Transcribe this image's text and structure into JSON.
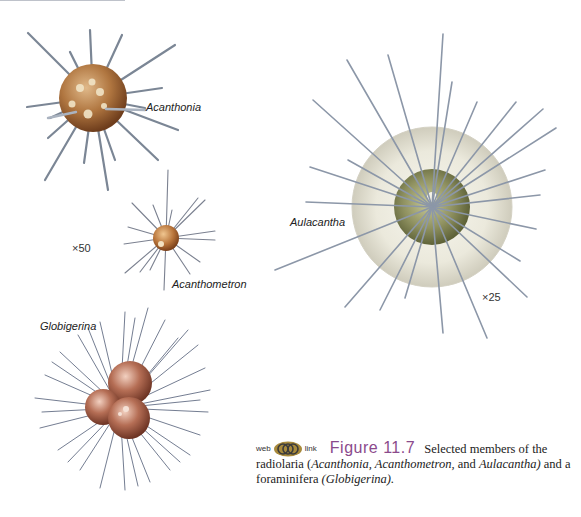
{
  "figure": {
    "number": "Figure 11.7",
    "caption_lead": "Selected members of the",
    "caption_line2_pre": "radiolaria (",
    "caption_taxa_1": "Acanthonia, Acanthometron,",
    "caption_and": " and ",
    "caption_taxa_2": "Aulacantha)",
    "caption_line2_post": " and a",
    "caption_line3_pre": "foraminifera ",
    "caption_taxa_3": "(Globigerina).",
    "web_label": "web",
    "link_label": "link",
    "web_icon": "linked-rings-icon",
    "accent_color": "#8b4a8c"
  },
  "specimens": [
    {
      "name": "Acanthonia",
      "type": "radiolarian"
    },
    {
      "name": "Acanthometron",
      "type": "radiolarian"
    },
    {
      "name": "Aulacantha",
      "type": "radiolarian"
    },
    {
      "name": "Globigerina",
      "type": "foraminifera"
    }
  ],
  "magnifications": {
    "left_group": "×50",
    "aulacantha": "×25"
  }
}
